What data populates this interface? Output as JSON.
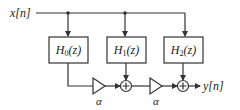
{
  "diagram": {
    "type": "block-diagram",
    "input": {
      "label": "x[n]"
    },
    "output": {
      "label": "y[n]"
    },
    "filters": [
      {
        "id": "H0",
        "name": "H",
        "sub": "0",
        "arg": "(z)"
      },
      {
        "id": "H1",
        "name": "H",
        "sub": "1",
        "arg": "(z)"
      },
      {
        "id": "H2",
        "name": "H",
        "sub": "2",
        "arg": "(z)"
      }
    ],
    "gains": [
      {
        "id": "gain1",
        "label": "α"
      },
      {
        "id": "gain2",
        "label": "α"
      }
    ],
    "adders": [
      {
        "id": "adder1",
        "symbol": "+"
      },
      {
        "id": "adder2",
        "symbol": "+"
      }
    ],
    "colors": {
      "stroke": "#333333",
      "background": "#ffffff"
    }
  }
}
